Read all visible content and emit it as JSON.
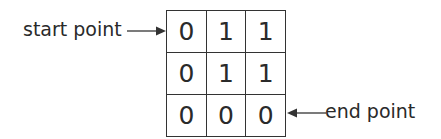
{
  "diagram": {
    "type": "grid-path",
    "grid": {
      "rows": [
        [
          "0",
          "1",
          "1"
        ],
        [
          "0",
          "1",
          "1"
        ],
        [
          "0",
          "0",
          "0"
        ]
      ]
    },
    "labels": {
      "start": "start point",
      "end": "end point"
    },
    "arrows": {
      "start": {
        "icon": "arrow-right-icon",
        "target_cell": [
          0,
          0
        ]
      },
      "end": {
        "icon": "arrow-left-icon",
        "target_cell": [
          2,
          2
        ]
      }
    },
    "colors": {
      "line": "#333333",
      "text": "#2a2a2a",
      "background": "#ffffff"
    }
  }
}
